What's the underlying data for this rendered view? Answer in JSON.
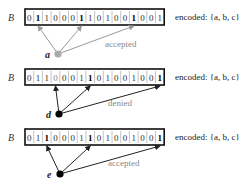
{
  "figure": {
    "rows": [
      {
        "array_label": "B",
        "bits": [
          "0",
          "1",
          "1",
          "0",
          "0",
          "0",
          "1",
          "1",
          "0",
          "1",
          "0",
          "0",
          "1",
          "0",
          "0",
          "1"
        ],
        "bold_indices": [
          1,
          6,
          12
        ],
        "gray_indices": [],
        "encoded_text": "encoded: {a, b, c}",
        "query_element": "a",
        "query_targets": [
          1,
          6,
          12
        ],
        "status": "accepted",
        "node_color": "#aaaaaa",
        "edge_color": "#9a9a9a"
      },
      {
        "array_label": "B",
        "bits": [
          "0",
          "1",
          "1",
          "0",
          "0",
          "0",
          "1",
          "1",
          "0",
          "1",
          "0",
          "0",
          "1",
          "0",
          "0",
          "1"
        ],
        "bold_indices": [
          7,
          15
        ],
        "gray_indices": [
          3
        ],
        "encoded_text": "encoded: {a, b, c}",
        "query_element": "d",
        "query_targets": [
          3,
          7,
          15
        ],
        "status": "denied",
        "node_color": "#000000",
        "edge_color": "#222222"
      },
      {
        "array_label": "B",
        "bits": [
          "0",
          "1",
          "1",
          "0",
          "0",
          "0",
          "1",
          "1",
          "0",
          "1",
          "0",
          "0",
          "1",
          "0",
          "0",
          "1"
        ],
        "bold_indices": [
          2,
          7,
          15
        ],
        "gray_indices": [],
        "encoded_text": "encoded: {a, b, c}",
        "query_element": "e",
        "query_targets": [
          2,
          7,
          15
        ],
        "status": "accepted",
        "node_color": "#000000",
        "edge_color": "#222222"
      }
    ]
  }
}
